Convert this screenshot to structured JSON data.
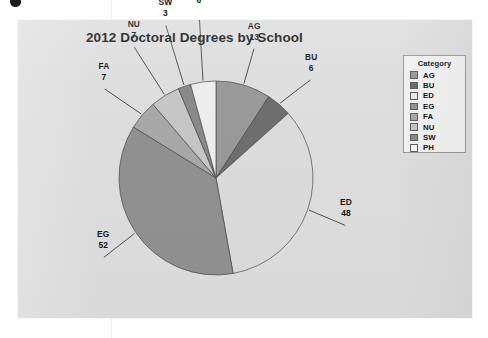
{
  "page": {
    "background_color": "#ffffff",
    "panel_color": "#dedede"
  },
  "chart_data": {
    "type": "pie",
    "title": "2012 Doctoral Degrees by School",
    "xlabel": "",
    "ylabel": "",
    "legend_title": "Category",
    "legend_position": "right",
    "total": 142,
    "start_angle_deg": 0,
    "direction": "clockwise",
    "categories": [
      "AG",
      "BU",
      "ED",
      "EG",
      "FA",
      "NU",
      "SW",
      "PH"
    ],
    "values": [
      13,
      6,
      48,
      52,
      7,
      7,
      3,
      6
    ],
    "colors": [
      "#9a9a9a",
      "#6e6e6e",
      "#dcdcdc",
      "#919191",
      "#a8a8a8",
      "#c6c6c6",
      "#8a8a8a",
      "#ededed"
    ],
    "slices": [
      {
        "label": "AG",
        "value": 13,
        "color": "#9a9a9a"
      },
      {
        "label": "BU",
        "value": 6,
        "color": "#6e6e6e"
      },
      {
        "label": "ED",
        "value": 48,
        "color": "#dcdcdc"
      },
      {
        "label": "EG",
        "value": 52,
        "color": "#919191"
      },
      {
        "label": "FA",
        "value": 7,
        "color": "#a8a8a8"
      },
      {
        "label": "NU",
        "value": 7,
        "color": "#c6c6c6"
      },
      {
        "label": "SW",
        "value": 3,
        "color": "#8a8a8a"
      },
      {
        "label": "PH",
        "value": 6,
        "color": "#ededed"
      }
    ],
    "data_labels": [
      {
        "name": "AG",
        "value": "13"
      },
      {
        "name": "BU",
        "value": "6"
      },
      {
        "name": "ED",
        "value": "48"
      },
      {
        "name": "EG",
        "value": "52"
      },
      {
        "name": "FA",
        "value": "7"
      },
      {
        "name": "NU",
        "value": "7"
      },
      {
        "name": "SW",
        "value": "3"
      },
      {
        "name": "PH",
        "value": "6"
      }
    ]
  },
  "legend": {
    "title": "Category",
    "items": [
      {
        "label": "AG",
        "color": "#9a9a9a"
      },
      {
        "label": "BU",
        "color": "#6e6e6e"
      },
      {
        "label": "ED",
        "color": "#e6e6e6"
      },
      {
        "label": "EG",
        "color": "#919191"
      },
      {
        "label": "FA",
        "color": "#a8a8a8"
      },
      {
        "label": "NU",
        "color": "#c6c6c6"
      },
      {
        "label": "SW",
        "color": "#8a8a8a"
      },
      {
        "label": "PH",
        "color": "#f5f5f5"
      }
    ]
  }
}
